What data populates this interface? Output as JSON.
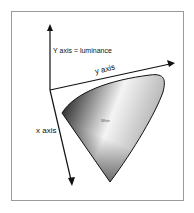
{
  "diagram": {
    "labels": {
      "y_luminance": "Y axis = luminance",
      "y_axis": "y axis",
      "x_axis": "x axis",
      "white": "White"
    },
    "colors": {
      "frame": "#9a9a9a",
      "axis": "#111111",
      "gamut_dark": "#222222",
      "gamut_light": "#f2f2f2"
    }
  }
}
